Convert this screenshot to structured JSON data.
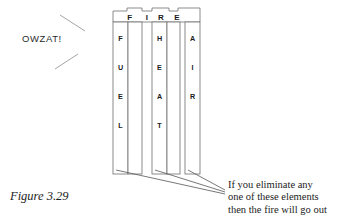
{
  "figure": {
    "caption": "Figure 3.29",
    "exclamation": "OWZAT!",
    "title_letters": [
      "F",
      "I",
      "R",
      "E"
    ],
    "columns": [
      {
        "name": "fuel",
        "letters": [
          "F",
          "U",
          "E",
          "L"
        ]
      },
      {
        "name": "heat",
        "letters": [
          "H",
          "E",
          "A",
          "T"
        ]
      },
      {
        "name": "air",
        "letters": [
          "A",
          "I",
          "R"
        ]
      }
    ],
    "note": {
      "line1": "If you eliminate any",
      "line2": "one of these elements",
      "line3": "then the fire will go out"
    },
    "colors": {
      "background": "#ffffff",
      "stroke": "#6e6e6e",
      "text": "#1a1a1a",
      "leader": "#555555",
      "spark": "#9a9a9a"
    }
  }
}
